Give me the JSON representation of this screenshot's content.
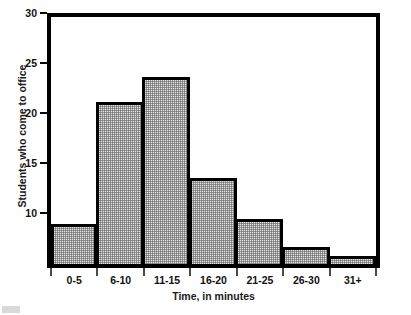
{
  "chart_data": {
    "type": "bar",
    "title": "",
    "xlabel": "Time, in minutes",
    "ylabel": "Students who come to office",
    "categories": [
      "0-5",
      "6-10",
      "11-15",
      "16-20",
      "21-25",
      "26-30",
      "31+"
    ],
    "values": [
      8.5,
      20.7,
      23.2,
      13.1,
      9.0,
      6.2,
      5.3
    ],
    "ylim": [
      4.5,
      30
    ],
    "yticks": [
      10,
      15,
      20,
      25,
      30
    ],
    "ytick_labels": [
      "10",
      "15",
      "20",
      "25",
      "30"
    ],
    "grid": false,
    "legend": null,
    "bar_fill": "#e2e2e2",
    "bar_edge": "#000000",
    "frame_color": "#000000",
    "background": "#ffffff"
  }
}
